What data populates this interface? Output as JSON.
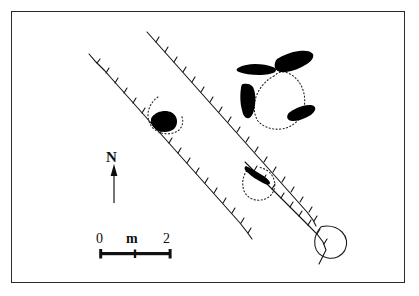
{
  "figure": {
    "kind": "archaeological-site-plan",
    "background_color": "#ffffff",
    "frame_color": "#2b2b2b",
    "ink_color": "#000000"
  },
  "north_arrow": {
    "label": "N",
    "icon": "north-arrow-icon"
  },
  "scale_bar": {
    "start_label": "0",
    "unit_label": "m",
    "end_label": "2",
    "ticks": [
      "0",
      "1",
      "2"
    ],
    "length_meters": 2
  },
  "legend_note": {
    "solid_fill_meaning": "orthostat / standing stone (solid black)",
    "dotted_line_meaning": "conjectural wall or hut circle edge (dotted)",
    "hachured_line_meaning": "field bank / lynchet with hachures"
  },
  "features": {
    "hachured_banks": [
      {
        "name": "bank-west",
        "hachure_count": 14
      },
      {
        "name": "bank-central",
        "hachure_count": 20
      },
      {
        "name": "bank-east",
        "hachure_count": 13
      }
    ],
    "hut_circles": [
      {
        "name": "hut-circle-north-east",
        "stone_count": 4
      },
      {
        "name": "hut-circle-west",
        "stone_count": 1
      },
      {
        "name": "hut-circle-south",
        "stone_count": 1
      }
    ],
    "boulder_outlines": [
      {
        "name": "boulder-south-east"
      }
    ]
  }
}
